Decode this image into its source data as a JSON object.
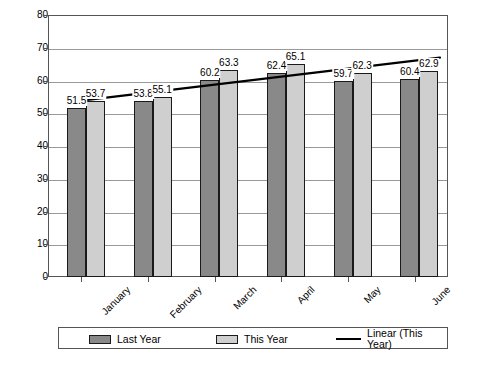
{
  "chart_data": {
    "type": "bar",
    "title": "",
    "xlabel": "",
    "ylabel": "",
    "ylim": [
      0,
      80
    ],
    "yticks": [
      0,
      10,
      20,
      30,
      40,
      50,
      60,
      70,
      80
    ],
    "grid": true,
    "legend_position": "bottom",
    "categories": [
      "January",
      "February",
      "March",
      "April",
      "May",
      "June"
    ],
    "series": [
      {
        "name": "Last Year",
        "color": "#898989",
        "values": [
          51.5,
          53.8,
          60.2,
          62.4,
          59.7,
          60.4
        ]
      },
      {
        "name": "This Year",
        "color": "#cfcfcf",
        "values": [
          53.7,
          55.1,
          63.3,
          65.1,
          62.3,
          62.9
        ]
      },
      {
        "name": "Linear (This Year)",
        "type": "line",
        "color": "#000000",
        "endpoints": [
          53.5,
          67.0
        ]
      }
    ],
    "data_labels": {
      "last_year": [
        "51.5",
        "53.8",
        "60.2",
        "62.4",
        "59.7",
        "60.4"
      ],
      "this_year": [
        "53.7",
        "55.1",
        "63.3",
        "65.1",
        "62.3",
        "62.9"
      ]
    },
    "ytick_labels": [
      "0",
      "10",
      "20",
      "30",
      "40",
      "50",
      "60",
      "70",
      "80"
    ]
  },
  "legend": {
    "items": [
      {
        "label": "Last Year",
        "marker": "swatch-dark"
      },
      {
        "label": "This Year",
        "marker": "swatch-light"
      },
      {
        "label": "Linear (This Year)",
        "marker": "line-black"
      }
    ]
  },
  "caption": {
    "text": ""
  }
}
